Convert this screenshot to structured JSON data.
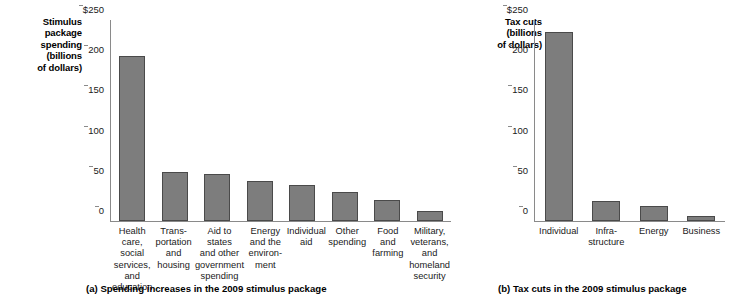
{
  "chart_data": [
    {
      "type": "bar",
      "panel": "a",
      "title": "(a) Spending increases in the 2009 stimulus package",
      "ylabel": "Stimulus\npackage\nspending\n(billions\nof dollars)",
      "xlabel": "",
      "ylim": [
        0,
        250
      ],
      "yticks": [
        0,
        50,
        100,
        150,
        200,
        250
      ],
      "ytick_labels": [
        "0",
        "50",
        "100",
        "150",
        "200",
        "$250"
      ],
      "grid": false,
      "legend": "none",
      "bar_color": "#7d7d7d",
      "bar_edge_color": "#4a4a4a",
      "categories": [
        "Health care,\nsocial services,\nand education",
        "Trans-\nportation\nand\nhousing",
        "Aid to states\nand other\ngovernment\nspending",
        "Energy\nand the\nenviron-\nment",
        "Individual\naid",
        "Other\nspending",
        "Food\nand\nfarming",
        "Military,\nveterans,\nand\nhomeland\nsecurity"
      ],
      "values": [
        205,
        61,
        59,
        50,
        45,
        36,
        26,
        12
      ]
    },
    {
      "type": "bar",
      "panel": "b",
      "title": "(b) Tax cuts in the 2009 stimulus package",
      "ylabel": "Tax cuts\n(billions\nof dollars)",
      "xlabel": "",
      "ylim": [
        0,
        250
      ],
      "yticks": [
        0,
        50,
        100,
        150,
        200,
        250
      ],
      "ytick_labels": [
        "0",
        "50",
        "100",
        "150",
        "200",
        "$250"
      ],
      "grid": false,
      "legend": "none",
      "bar_color": "#7d7d7d",
      "bar_edge_color": "#4a4a4a",
      "categories": [
        "Individual",
        "Infra-\nstructure",
        "Energy",
        "Business"
      ],
      "values": [
        235,
        25,
        19,
        6
      ]
    }
  ],
  "figure_a": {
    "ylabel": "Stimulus\npackage\nspending\n(billions\nof dollars)",
    "caption": "(a) Spending increases in the 2009 stimulus package"
  },
  "figure_b": {
    "ylabel": "Tax cuts\n(billions\nof dollars)",
    "caption": "(b) Tax cuts in the 2009 stimulus package"
  }
}
